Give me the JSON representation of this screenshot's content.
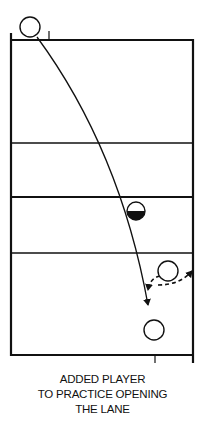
{
  "diagram": {
    "type": "court-drill",
    "caption_lines": [
      "ADDED PLAYER",
      "TO PRACTICE OPENING",
      "THE LANE"
    ],
    "colors": {
      "ink": "#111111",
      "background": "#ffffff"
    },
    "court": {
      "left": 11,
      "right": 193,
      "top": 40,
      "bottom": 355,
      "lines_y": [
        143,
        197,
        253
      ]
    },
    "players": [
      {
        "id": "top-player",
        "shape": "open-circle",
        "cx": 30,
        "cy": 27,
        "r": 10
      },
      {
        "id": "defender",
        "shape": "half-filled-circle",
        "cx": 136,
        "cy": 211,
        "r": 9
      },
      {
        "id": "added-player",
        "shape": "open-circle",
        "cx": 168,
        "cy": 271,
        "r": 10
      },
      {
        "id": "bottom-player",
        "shape": "open-circle",
        "cx": 154,
        "cy": 330,
        "r": 10
      }
    ],
    "paths": [
      {
        "id": "main-run",
        "style": "solid",
        "arrow": true
      },
      {
        "id": "cut-from-sideline",
        "style": "dashed",
        "arrow": true
      },
      {
        "id": "cut-to-lane",
        "style": "dashed",
        "arrow": true
      }
    ]
  }
}
